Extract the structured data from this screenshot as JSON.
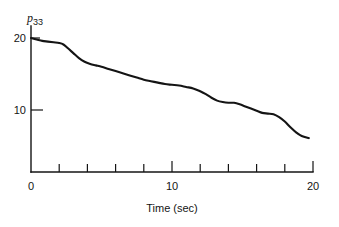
{
  "chart_data": {
    "type": "line",
    "title": "",
    "xlabel": "Time (sec)",
    "ylabel": "p33",
    "ylabel_base": "p",
    "ylabel_subscript": "33",
    "xlim": [
      0,
      20
    ],
    "ylim": [
      0,
      21
    ],
    "grid": false,
    "legend": null,
    "x_tick_labels": [
      "0",
      "10",
      "20"
    ],
    "x_tick_label_values": [
      0,
      10,
      20
    ],
    "x_minor_ticks": [
      2,
      4,
      6,
      8,
      12,
      14,
      16,
      18
    ],
    "y_tick_labels": [
      "10",
      "20"
    ],
    "y_tick_label_values": [
      10,
      20
    ],
    "line_color": "#141414",
    "series": [
      {
        "name": "p33",
        "x": [
          0.0,
          0.4,
          0.8,
          1.2,
          1.6,
          2.0,
          2.3,
          2.6,
          3.0,
          3.4,
          3.8,
          4.2,
          4.6,
          5.0,
          5.5,
          6.0,
          6.5,
          7.0,
          7.5,
          8.0,
          8.5,
          9.0,
          9.5,
          10.0,
          10.5,
          11.0,
          11.5,
          12.0,
          12.4,
          12.8,
          13.2,
          13.6,
          14.0,
          14.4,
          14.8,
          15.2,
          15.6,
          16.0,
          16.4,
          16.8,
          17.2,
          17.6,
          18.0,
          18.4,
          18.8,
          19.2,
          19.7
        ],
        "y": [
          20.0,
          19.8,
          19.6,
          19.5,
          19.4,
          19.3,
          19.1,
          18.6,
          17.9,
          17.2,
          16.7,
          16.4,
          16.2,
          16.0,
          15.7,
          15.4,
          15.1,
          14.8,
          14.5,
          14.2,
          14.0,
          13.8,
          13.6,
          13.5,
          13.4,
          13.2,
          13.0,
          12.6,
          12.2,
          11.7,
          11.3,
          11.1,
          11.0,
          11.0,
          10.8,
          10.5,
          10.2,
          9.9,
          9.6,
          9.5,
          9.4,
          9.0,
          8.4,
          7.6,
          6.9,
          6.4,
          6.1
        ]
      }
    ]
  }
}
